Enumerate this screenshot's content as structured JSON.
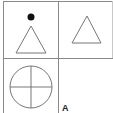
{
  "diagram": {
    "type": "matrix-puzzle",
    "grid": {
      "rows": 2,
      "cols": 2,
      "line_color": "#8a8a8a",
      "shape_stroke": "#777777",
      "fill_color": "#111111"
    },
    "cells": [
      {
        "position": "top-left",
        "content": [
          "filled-dot",
          "triangle-outline"
        ]
      },
      {
        "position": "top-right",
        "content": [
          "triangle-outline"
        ]
      },
      {
        "position": "bottom-left",
        "content": [
          "circle-with-cross"
        ]
      },
      {
        "position": "bottom-right",
        "content": [
          "empty"
        ]
      }
    ],
    "option_label": "A"
  }
}
